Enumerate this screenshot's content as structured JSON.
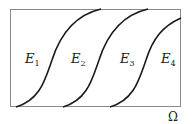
{
  "diagram": {
    "domain_label": "Ω",
    "regions": [
      {
        "letter": "E",
        "sub": "1"
      },
      {
        "letter": "E",
        "sub": "2"
      },
      {
        "letter": "E",
        "sub": "3"
      },
      {
        "letter": "E",
        "sub": "4"
      }
    ],
    "colors": {
      "frame": "#888888",
      "curve": "#1a1a1a",
      "text": "#222222"
    }
  }
}
